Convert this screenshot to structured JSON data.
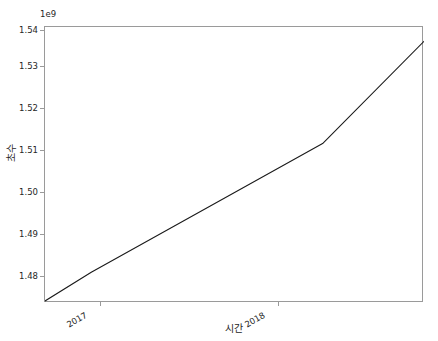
{
  "chart_data": {
    "type": "line",
    "title": "",
    "xlabel": "시간",
    "ylabel": "초수",
    "y_offset_text": "1e9",
    "y_offset_multiplier": 1000000000,
    "grid": false,
    "legend": null,
    "xlim": [
      "2016-10-20",
      "2018-06-10"
    ],
    "ylim": [
      1474000000,
      1541500000
    ],
    "xtick_labels": [
      "2017",
      "2018"
    ],
    "xtick_positions": [
      "2017-01-01",
      "2018-01-01"
    ],
    "ytick_labels": [
      "1.48",
      "1.49",
      "1.50",
      "1.51",
      "1.52",
      "1.53",
      "1.54"
    ],
    "ytick_values": [
      1480000000,
      1490000000,
      1500000000,
      1510000000,
      1520000000,
      1530000000,
      1540000000
    ],
    "series": [
      {
        "name": "초수",
        "color": "#1a1a1a",
        "linewidth": 1,
        "x": [
          "2016-10-20",
          "2017-01-01",
          "2018-01-01",
          "2018-06-10"
        ],
        "y": [
          1474500000,
          1481500000,
          1513000000,
          1538000000
        ]
      }
    ],
    "axis_color": "#9a9a9a",
    "background_color": "#ffffff",
    "text_color": "#262626"
  }
}
